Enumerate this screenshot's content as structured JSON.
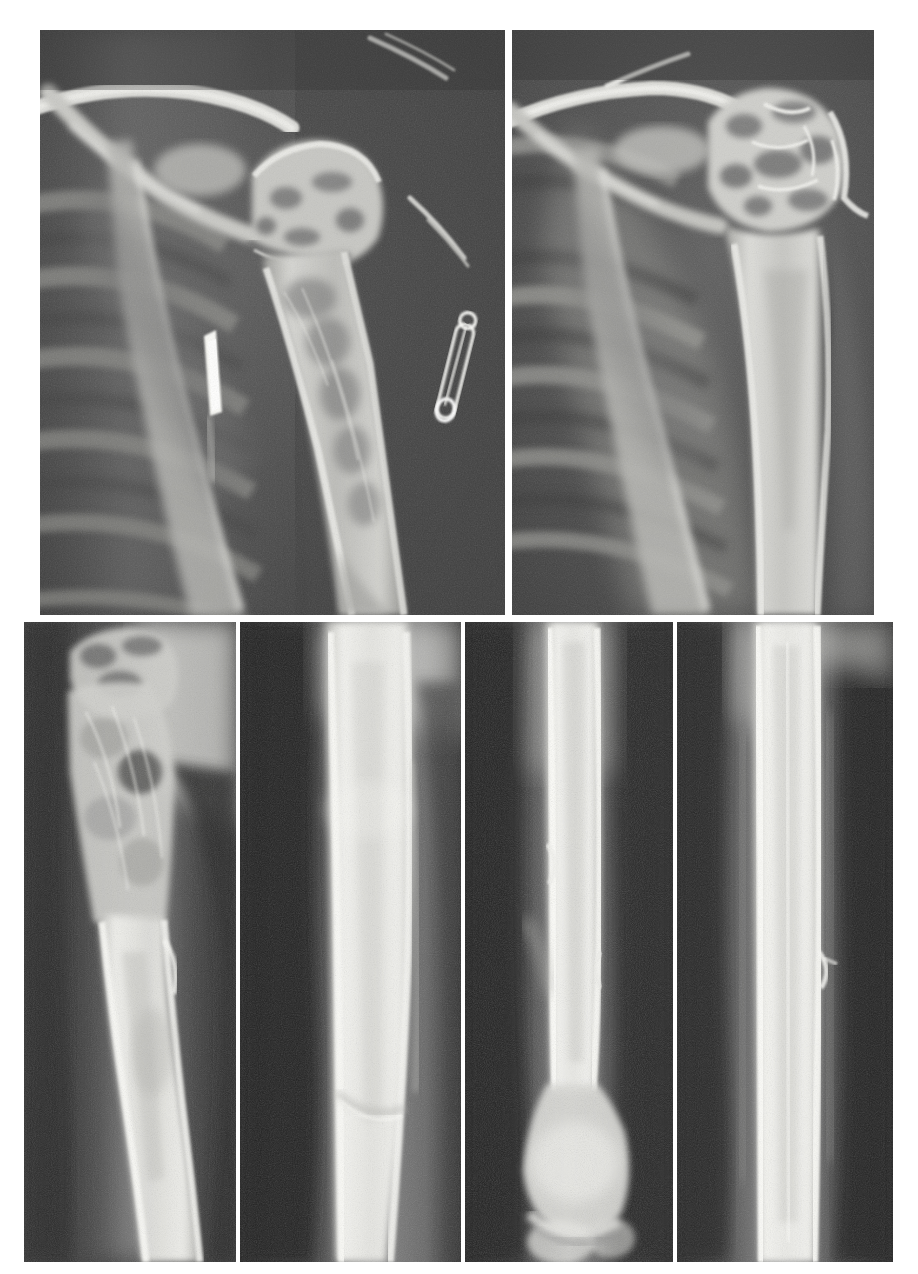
{
  "figure": {
    "kind": "radiograph-plate",
    "title": "",
    "caption": "",
    "background_color": "#ffffff",
    "width": 918,
    "height": 1274,
    "rows": 2,
    "panel_count": 6,
    "film_base_color": "#4a4a4a",
    "bone_color": "#d8d8d6",
    "metal_color": "#fdfdfb",
    "soft_tissue_color": "#6e6e6e"
  },
  "panels": [
    {
      "id": "panel-top-left",
      "label": "",
      "row": 1,
      "column": 1,
      "x": 40,
      "y": 30,
      "width": 465,
      "height": 585,
      "view": "shoulder-ap-pathologic-fracture",
      "anatomy": "left shoulder, proximal humerus",
      "findings": "permeative lytic destruction of proximal humeral metadiaphysis with pathologic fracture and cortical breakthrough",
      "artifacts": [
        "safety-pin",
        "metallic-rod-fragment",
        "overlying-wire"
      ],
      "film_tone": "#474747",
      "bone_tone": "#cfcfcb"
    },
    {
      "id": "panel-top-right",
      "label": "",
      "row": 1,
      "column": 2,
      "x": 512,
      "y": 30,
      "width": 362,
      "height": 585,
      "view": "shoulder-ap",
      "anatomy": "shoulder girdle, clavicle, scapula, ribs, proximal humerus",
      "findings": "lytic destruction of humeral head and surgical neck with coarse trabecular disruption",
      "artifacts": [],
      "film_tone": "#4d4d4d",
      "bone_tone": "#d7d7d3"
    },
    {
      "id": "panel-bottom-1",
      "label": "",
      "row": 2,
      "column": 1,
      "x": 24,
      "y": 622,
      "width": 212,
      "height": 640,
      "view": "humerus-ap",
      "anatomy": "proximal and mid humeral shaft",
      "findings": "expansile lesion of proximal shaft with cortical thinning and angulation",
      "artifacts": [],
      "film_tone": "#3e3e3e",
      "bone_tone": "#e2e2de"
    },
    {
      "id": "panel-bottom-2",
      "label": "",
      "row": 2,
      "column": 2,
      "x": 240,
      "y": 622,
      "width": 221,
      "height": 640,
      "view": "humerus-lateral",
      "anatomy": "mid humeral shaft",
      "findings": "thickened sclerotic cortex with oblique fracture line distally",
      "artifacts": [],
      "film_tone": "#3a3a3a",
      "bone_tone": "#e4e4e0"
    },
    {
      "id": "panel-bottom-3",
      "label": "",
      "row": 2,
      "column": 3,
      "x": 465,
      "y": 622,
      "width": 208,
      "height": 640,
      "view": "humerus-ap-distal",
      "anatomy": "humeral shaft to distal humerus and elbow",
      "findings": "diaphyseal cortical irregularity with distal metaphyseal sclerosis",
      "artifacts": [],
      "film_tone": "#3c3c3c",
      "bone_tone": "#e0e0dc"
    },
    {
      "id": "panel-bottom-4",
      "label": "",
      "row": 2,
      "column": 4,
      "x": 677,
      "y": 622,
      "width": 216,
      "height": 640,
      "view": "humerus-lateral-distal",
      "anatomy": "humeral shaft, lateral projection",
      "findings": "uniform dense cortical column with faint periosteal reaction",
      "artifacts": [
        "cortical-step"
      ],
      "film_tone": "#3b3b3b",
      "bone_tone": "#dedeDA"
    }
  ],
  "annotations": {
    "safety_pin": {
      "panel": "panel-top-left",
      "x": 468,
      "y": 345,
      "description": "safety pin overlying soft tissue"
    },
    "metal_rod": {
      "panel": "panel-top-left",
      "x": 206,
      "y": 355,
      "description": "dense metallic linear density"
    }
  }
}
